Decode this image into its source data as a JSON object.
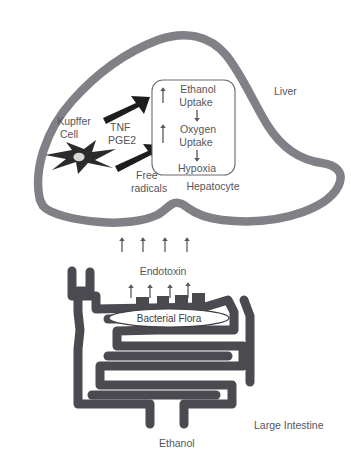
{
  "figure": {
    "width": 351,
    "height": 464,
    "background_color": "#ffffff"
  },
  "colors": {
    "organ_outline_gray": "#808086",
    "intestine_gray": "#4a4a50",
    "text_gray": "#55555a",
    "bold_arrow_black": "#1d1d1d",
    "cell_black": "#2b2b2b",
    "nucleus_light": "#d8d8d2"
  },
  "liver": {
    "label": "Liver",
    "hepatocyte_label": "Hepatocyte",
    "kupffer_cell": {
      "label_line1": "Kupffer",
      "label_line2": "Cell",
      "icon": "stellate-cell-icon"
    },
    "mediators": {
      "line1": "TNF",
      "line2": "PGE2",
      "arrow_icon": "bold-arrow-up-right-icon"
    },
    "free_radicals": {
      "line1": "Free",
      "line2": "radicals",
      "arrow_icon": "bold-arrow-up-right-icon"
    },
    "hepatocyte_box": {
      "steps": [
        {
          "line1": "Ethanol",
          "line2": "Uptake",
          "trend": "up",
          "trend_icon": "arrow-up-icon"
        },
        {
          "line1": "Oxygen",
          "line2": "Uptake",
          "trend": "up",
          "trend_icon": "arrow-up-icon"
        },
        {
          "line1": "Hypoxia",
          "line2": "",
          "trend": "none",
          "trend_icon": ""
        }
      ],
      "connector_icon": "arrow-down-icon",
      "connector_count": 2,
      "internal_up_arrow_count": 2
    }
  },
  "transit": {
    "arrow_icon": "arrow-up-icon",
    "arrow_count": 4,
    "description": "endotoxin rising from gut to liver"
  },
  "intestine": {
    "label": "Large Intestine",
    "endotoxin_label": "Endotoxin",
    "ethanol_label": "Ethanol",
    "bacterial_flora_label": "Bacterial Flora",
    "bacteria_arrow_icon": "arrow-up-icon",
    "bacteria_arrow_count": 4,
    "bacteria_colony_count": 5
  },
  "caption": {
    "text": ""
  }
}
